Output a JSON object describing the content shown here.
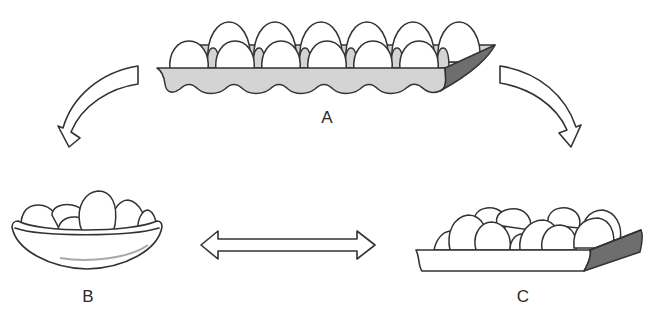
{
  "diagram": {
    "nodes": [
      {
        "id": "A",
        "label": "A",
        "object": "egg carton with 12 eggs in two rows"
      },
      {
        "id": "B",
        "label": "B",
        "object": "bowl with a pile of eggs"
      },
      {
        "id": "C",
        "label": "C",
        "object": "flat tray with loosely arranged eggs"
      }
    ],
    "arrows": [
      {
        "from": "A",
        "to": "B",
        "style": "curved hollow arrow"
      },
      {
        "from": "A",
        "to": "C",
        "style": "curved hollow arrow"
      },
      {
        "from": "B",
        "to": "C",
        "style": "double-headed hollow arrow"
      }
    ],
    "colors": {
      "outline": "#333333",
      "carton_fill": "#d4d4d4",
      "shadow_fill": "#6e6e6e",
      "egg_fill": "#ffffff"
    }
  },
  "labels": {
    "a": "A",
    "b": "B",
    "c": "C"
  }
}
